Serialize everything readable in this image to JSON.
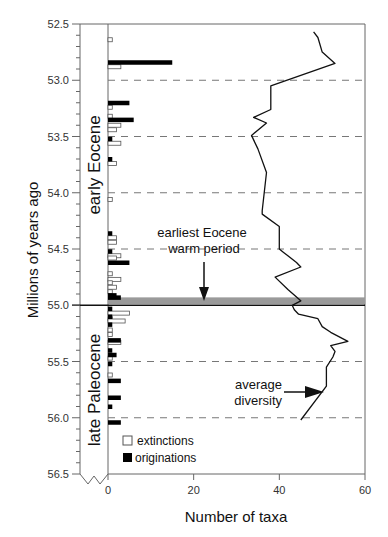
{
  "chart_data": {
    "type": "bar",
    "title": "",
    "ylabel": "Millions of years ago",
    "xlabel": "Number of taxa",
    "ylim": [
      52.5,
      56.5
    ],
    "xlim": [
      0,
      60
    ],
    "y_ticks": [
      "52.5",
      "53.0",
      "53.5",
      "54.0",
      "54.5",
      "55.0",
      "55.5",
      "56.0",
      "56.5"
    ],
    "x_ticks": [
      "0",
      "20",
      "40",
      "60"
    ],
    "grid": "dashed horizontal lines at 53.0, 53.5, 54.0, 54.5, 55.5, 56.0",
    "boundary_line": 55.0,
    "warm_period_band": [
      54.93,
      54.98
    ],
    "epochs": [
      {
        "label": "early Eocene",
        "from": 52.5,
        "to": 55.0
      },
      {
        "label": "late Paleocene",
        "from": 55.0,
        "to": 56.5
      }
    ],
    "legend": [
      {
        "label": "extinctions",
        "style": "open box"
      },
      {
        "label": "originations",
        "style": "filled box"
      }
    ],
    "annotations": [
      {
        "text": "earliest Eocene warm period",
        "arrow_to": [
          22,
          54.95
        ]
      },
      {
        "text": "average diversity",
        "arrow_to": [
          51,
          55.79
        ]
      }
    ],
    "series": [
      {
        "name": "originations",
        "type": "bar",
        "ma": [
          52.84,
          53.2,
          53.35,
          53.52,
          53.7,
          54.36,
          54.52,
          54.62,
          54.91,
          54.93,
          55.03,
          55.1,
          55.17,
          55.31,
          55.4,
          55.44,
          55.52,
          55.67,
          55.82,
          55.9,
          56.04
        ],
        "values": [
          15,
          5,
          6,
          1,
          1,
          1,
          1,
          5,
          2,
          3,
          1,
          1,
          1,
          3,
          1,
          2,
          1,
          3,
          3,
          1,
          3
        ]
      },
      {
        "name": "extinctions",
        "type": "bar",
        "ma": [
          52.64,
          52.88,
          53.24,
          53.32,
          53.4,
          53.44,
          53.56,
          53.74,
          54.06,
          54.4,
          54.44,
          54.56,
          54.58,
          54.72,
          54.77,
          54.8,
          54.84,
          54.88,
          55.07,
          55.12,
          55.14,
          55.22,
          55.26,
          55.33,
          55.47,
          55.62
        ],
        "values": [
          1,
          3,
          1,
          1,
          3,
          2,
          3,
          2,
          1,
          2,
          2,
          3,
          2,
          1,
          3,
          1,
          2,
          1,
          5,
          1,
          4,
          1,
          1,
          3,
          1,
          1
        ]
      },
      {
        "name": "average diversity",
        "type": "line",
        "ma": [
          52.57,
          52.62,
          52.75,
          52.85,
          53.05,
          53.26,
          53.33,
          53.38,
          53.49,
          53.61,
          53.82,
          54.16,
          54.19,
          54.3,
          54.5,
          54.53,
          54.62,
          54.66,
          54.75,
          54.86,
          54.96,
          55.0,
          55.04,
          55.08,
          55.12,
          55.19,
          55.24,
          55.32,
          55.36,
          55.41,
          55.46,
          55.55,
          55.72,
          56.02
        ],
        "values": [
          48,
          49,
          50,
          53,
          38,
          38,
          34,
          37,
          33.5,
          35,
          37,
          36,
          36,
          40,
          40,
          41,
          44,
          45,
          39,
          42,
          45,
          43,
          43.5,
          44.5,
          49,
          50,
          52,
          56,
          52,
          53,
          52.5,
          51,
          51,
          45
        ]
      }
    ]
  },
  "labels": {
    "ylabel": "Millions of years ago",
    "xlabel": "Number of taxa",
    "epoch_early": "early Eocene",
    "epoch_late": "late Paleocene",
    "annot_warm_1": "earliest Eocene",
    "annot_warm_2": "warm period",
    "annot_div_1": "average",
    "annot_div_2": "diversity",
    "legend_ext": "extinctions",
    "legend_orig": "originations",
    "yticks": [
      "52.5",
      "53.0",
      "53.5",
      "54.0",
      "54.5",
      "55.0",
      "55.5",
      "56.0",
      "56.5"
    ],
    "xticks": [
      "0",
      "20",
      "40",
      "60"
    ]
  },
  "colors": {
    "bar_fill": "#000000",
    "open_bar_stroke": "#555555",
    "line": "#111111",
    "band": "#9a9a9a",
    "frame": "#666666",
    "grid": "#777777"
  }
}
